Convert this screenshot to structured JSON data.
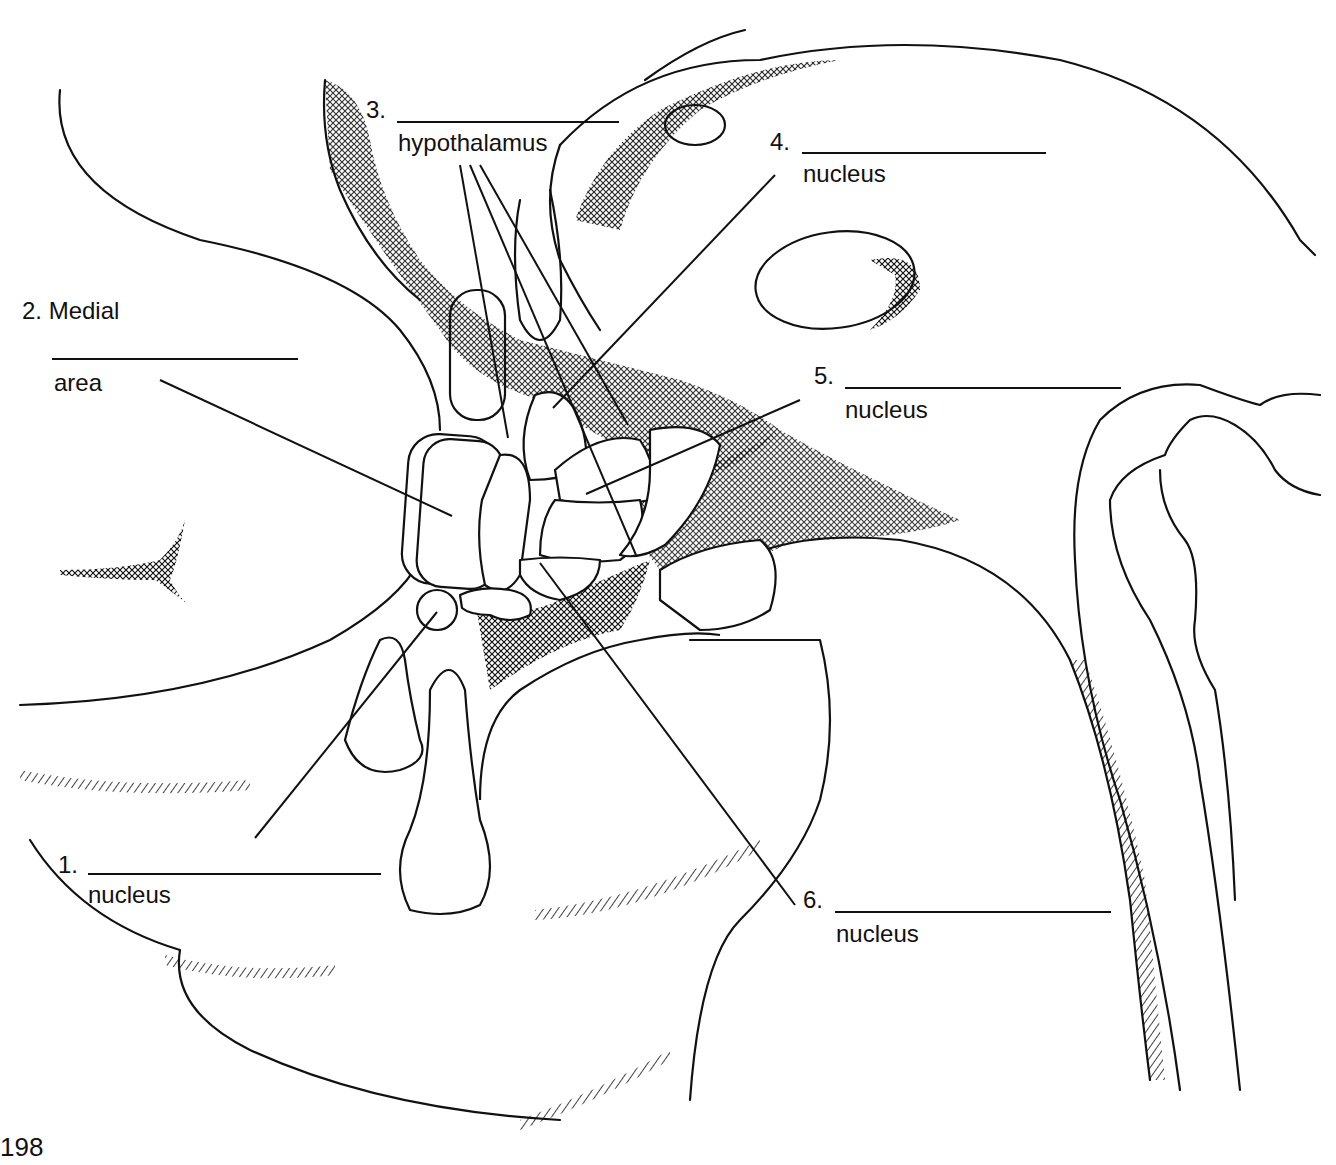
{
  "page": {
    "number": "198"
  },
  "diagram": {
    "labels": [
      {
        "id": 1,
        "prefix": "1.",
        "suffix": "nucleus",
        "answer_blank": ""
      },
      {
        "id": 2,
        "prefix": "2. Medial",
        "suffix": "area",
        "answer_blank": ""
      },
      {
        "id": 3,
        "prefix": "3.",
        "suffix": "hypothalamus",
        "answer_blank": ""
      },
      {
        "id": 4,
        "prefix": "4.",
        "suffix": "nucleus",
        "answer_blank": ""
      },
      {
        "id": 5,
        "prefix": "5.",
        "suffix": "nucleus",
        "answer_blank": ""
      },
      {
        "id": 6,
        "prefix": "6.",
        "suffix": "nucleus",
        "answer_blank": ""
      }
    ],
    "colors": {
      "ink": "#111111",
      "paper": "#ffffff"
    }
  }
}
